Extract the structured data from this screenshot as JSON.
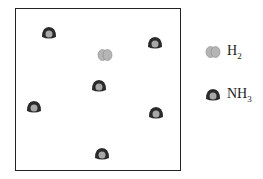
{
  "diagram": {
    "container": {
      "x": 15,
      "y": 8,
      "width": 166,
      "height": 163
    },
    "molecules": [
      {
        "type": "NH3",
        "x": 49,
        "y": 33
      },
      {
        "type": "NH3",
        "x": 155,
        "y": 43
      },
      {
        "type": "H2",
        "x": 105,
        "y": 55
      },
      {
        "type": "NH3",
        "x": 99,
        "y": 86
      },
      {
        "type": "NH3",
        "x": 34,
        "y": 107
      },
      {
        "type": "NH3",
        "x": 156,
        "y": 113
      },
      {
        "type": "NH3",
        "x": 102,
        "y": 154
      }
    ]
  },
  "legend": {
    "items": [
      {
        "type": "H2",
        "label_main": "H",
        "label_sub": "2",
        "icon": "h2-molecule-icon"
      },
      {
        "type": "NH3",
        "label_main": "NH",
        "label_sub": "3",
        "icon": "nh3-molecule-icon"
      }
    ]
  },
  "colors": {
    "nh3_outer": "#2a2a2a",
    "nh3_inner": "#a8a8a8",
    "h2_fill": "#b5b5b5",
    "h2_stroke": "#888888",
    "border": "#222222"
  }
}
